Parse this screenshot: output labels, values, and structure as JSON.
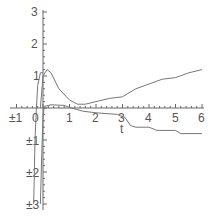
{
  "chart_data": {
    "type": "line",
    "title": "",
    "xlabel": "t",
    "ylabel": "",
    "xlim": [
      -1,
      6
    ],
    "ylim": [
      -3,
      3
    ],
    "grid": false,
    "legend": null,
    "x_ticks": [
      "±1",
      "0",
      "1",
      "2",
      "3",
      "4",
      "5",
      "6"
    ],
    "y_ticks": [
      "3",
      "2",
      "1",
      "±1",
      "±2",
      "±3"
    ],
    "series": [
      {
        "name": "curve-1",
        "points": [
          [
            -0.1,
            0.0
          ],
          [
            0.0,
            1.0
          ],
          [
            0.15,
            1.2
          ],
          [
            0.3,
            1.1
          ],
          [
            0.6,
            0.6
          ],
          [
            1.0,
            0.25
          ],
          [
            1.3,
            0.12
          ],
          [
            1.6,
            0.12
          ],
          [
            2.0,
            0.2
          ],
          [
            2.5,
            0.3
          ],
          [
            3.0,
            0.35
          ],
          [
            3.5,
            0.6
          ],
          [
            4.0,
            0.75
          ],
          [
            4.5,
            0.9
          ],
          [
            5.0,
            0.95
          ],
          [
            5.5,
            1.1
          ],
          [
            6.0,
            1.2
          ]
        ]
      },
      {
        "name": "curve-2",
        "points": [
          [
            -0.1,
            -3.0
          ],
          [
            -0.05,
            -1.5
          ],
          [
            0.0,
            -0.3
          ],
          [
            0.05,
            0.05
          ],
          [
            0.3,
            0.1
          ],
          [
            0.8,
            0.08
          ],
          [
            1.0,
            0.02
          ],
          [
            1.5,
            -0.1
          ],
          [
            2.0,
            -0.15
          ],
          [
            2.8,
            -0.2
          ],
          [
            3.1,
            -0.3
          ],
          [
            3.3,
            -0.55
          ],
          [
            3.5,
            -0.6
          ],
          [
            4.0,
            -0.6
          ],
          [
            4.3,
            -0.7
          ],
          [
            5.0,
            -0.7
          ],
          [
            5.2,
            -0.8
          ],
          [
            6.0,
            -0.8
          ]
        ]
      },
      {
        "name": "curve-3",
        "points": [
          [
            -0.35,
            -3.0
          ],
          [
            -0.3,
            -1.0
          ],
          [
            -0.25,
            0.0
          ],
          [
            -0.2,
            0.7
          ],
          [
            -0.1,
            1.1
          ],
          [
            0.0,
            1.1
          ]
        ]
      }
    ]
  },
  "axes": {
    "x_label": "t",
    "x_ticks": [
      {
        "label": "±1",
        "value": -1
      },
      {
        "label": "0",
        "value": 0
      },
      {
        "label": "1",
        "value": 1
      },
      {
        "label": "2",
        "value": 2
      },
      {
        "label": "3",
        "value": 3
      },
      {
        "label": "4",
        "value": 4
      },
      {
        "label": "5",
        "value": 5
      },
      {
        "label": "6",
        "value": 6
      }
    ],
    "y_ticks": [
      {
        "label": "3",
        "value": 3
      },
      {
        "label": "2",
        "value": 2
      },
      {
        "label": "1",
        "value": 1
      },
      {
        "label": "±1",
        "value": -1
      },
      {
        "label": "±2",
        "value": -2
      },
      {
        "label": "±3",
        "value": -3
      }
    ]
  },
  "colors": {
    "axis": "#666666",
    "curve": "#777777",
    "text": "#555555"
  }
}
